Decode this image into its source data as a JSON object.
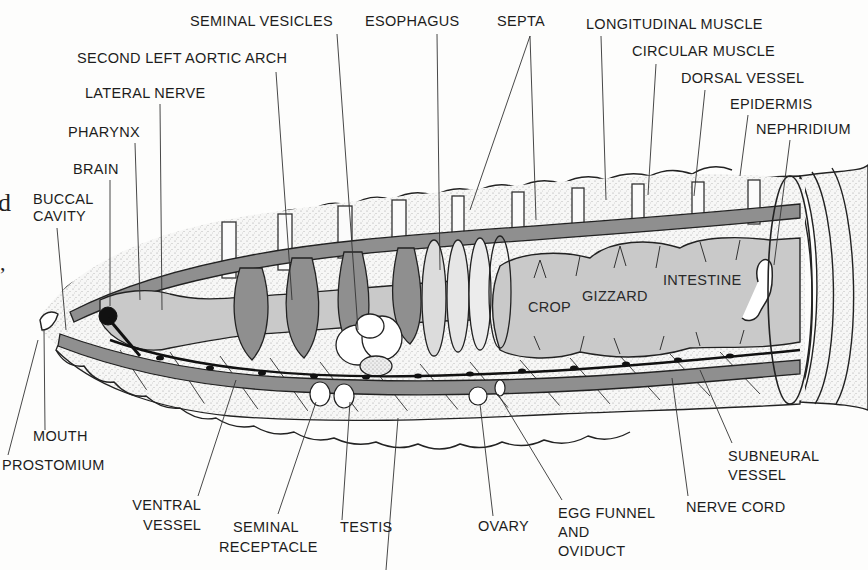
{
  "diagram": {
    "colors": {
      "background": "#fdfdfc",
      "ink": "#1d1d1d",
      "gut_fill": "#c9c9c9",
      "vessel_fill": "#8f8f8f",
      "skin_fill": "#f2f2f2",
      "stipple": "#b5b5b5"
    },
    "labels_top": {
      "seminal_vesicles": "SEMINAL VESICLES",
      "esophagus": "ESOPHAGUS",
      "septa": "SEPTA",
      "longitudinal_muscle": "LONGITUDINAL MUSCLE",
      "circular_muscle": "CIRCULAR MUSCLE",
      "dorsal_vessel": "DORSAL VESSEL",
      "epidermis": "EPIDERMIS",
      "nephridium": "NEPHRIDIUM",
      "second_left_aortic_arch": "SECOND LEFT AORTIC ARCH",
      "lateral_nerve": "LATERAL NERVE",
      "pharynx": "PHARYNX",
      "brain": "BRAIN",
      "buccal_cavity_1": "BUCCAL",
      "buccal_cavity_2": "CAVITY"
    },
    "labels_inner": {
      "crop": "CROP",
      "gizzard": "GIZZARD",
      "intestine": "INTESTINE"
    },
    "labels_bottom": {
      "mouth": "MOUTH",
      "prostomium": "PROSTOMIUM",
      "ventral_vessel_1": "VENTRAL",
      "ventral_vessel_2": "VESSEL",
      "seminal_receptacle_1": "SEMINAL",
      "seminal_receptacle_2": "RECEPTACLE",
      "testis": "TESTIS",
      "ovary": "OVARY",
      "egg_funnel_1": "EGG FUNNEL",
      "egg_funnel_2": "AND",
      "egg_funnel_3": "OVIDUCT",
      "nerve_cord": "NERVE CORD",
      "subneural_vessel_1": "SUBNEURAL",
      "subneural_vessel_2": "VESSEL"
    },
    "edge_fragments": {
      "left_char": "d",
      "left_punct": ","
    }
  }
}
